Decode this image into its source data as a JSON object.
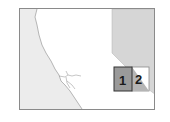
{
  "map": {
    "title": "",
    "colors": {
      "ocean": "#ececec",
      "land": "#ffffff",
      "neighbor_region": "#d6d6d6",
      "box1_fill": "#9a9a9a",
      "box2_fill": "#b5b5b5",
      "border": "#8a8a8a"
    },
    "inset_boxes": [
      {
        "label": "1"
      },
      {
        "label": "2"
      }
    ]
  }
}
